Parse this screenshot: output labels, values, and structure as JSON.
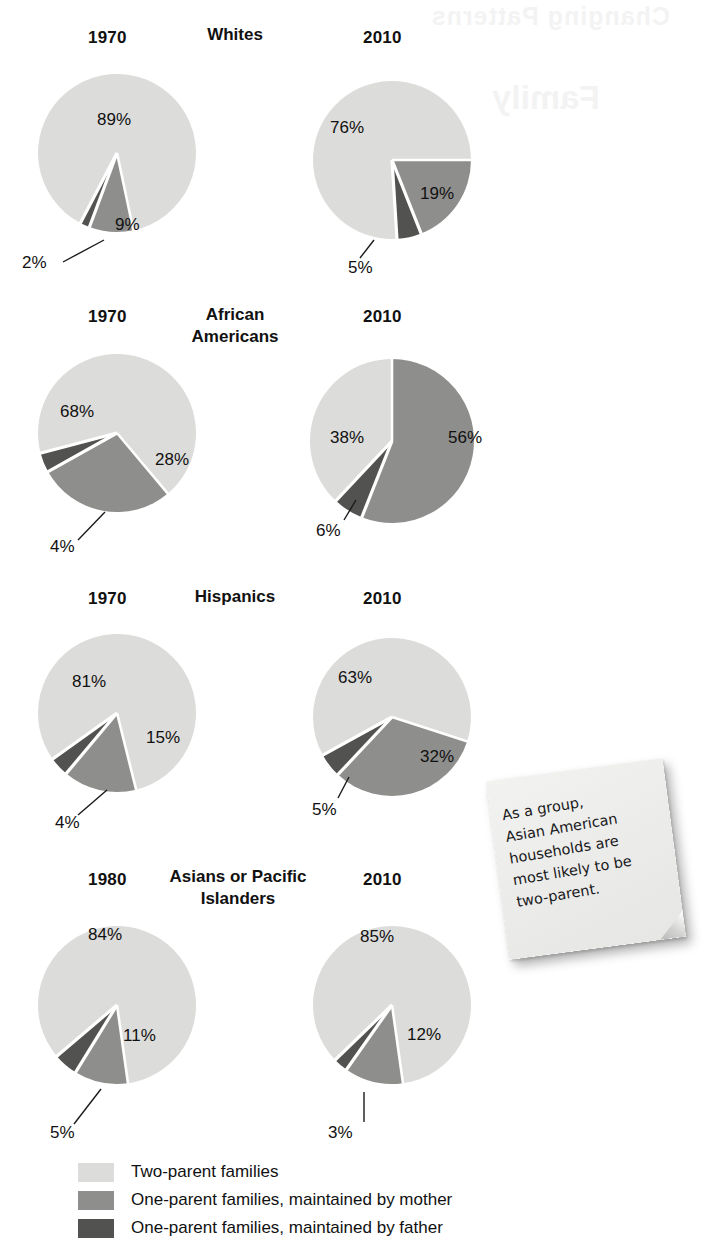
{
  "colors": {
    "two_parent": "#dcdcda",
    "mother": "#8e8e8c",
    "father": "#525250",
    "gap": "#ffffff",
    "text": "#111111",
    "note_paper": "#eeeeec"
  },
  "ghost_text": "Changing Patterns",
  "ghost_text2": "Family",
  "rows": [
    {
      "group": "Whites",
      "left": {
        "year": "1970",
        "two_parent": "89%",
        "mother": "9%",
        "father": "2%",
        "two_parent_value": 89,
        "mother_value": 9,
        "father_value": 2
      },
      "right": {
        "year": "2010",
        "two_parent": "76%",
        "mother": "19%",
        "father": "5%",
        "two_parent_value": 76,
        "mother_value": 19,
        "father_value": 5
      }
    },
    {
      "group": "African\nAmericans",
      "left": {
        "year": "1970",
        "two_parent": "68%",
        "mother": "28%",
        "father": "4%",
        "two_parent_value": 68,
        "mother_value": 28,
        "father_value": 4
      },
      "right": {
        "year": "2010",
        "two_parent": "38%",
        "mother": "56%",
        "father": "6%",
        "two_parent_value": 38,
        "mother_value": 56,
        "father_value": 6
      }
    },
    {
      "group": "Hispanics",
      "left": {
        "year": "1970",
        "two_parent": "81%",
        "mother": "15%",
        "father": "4%",
        "two_parent_value": 81,
        "mother_value": 15,
        "father_value": 4
      },
      "right": {
        "year": "2010",
        "two_parent": "63%",
        "mother": "32%",
        "father": "5%",
        "two_parent_value": 63,
        "mother_value": 32,
        "father_value": 5
      }
    },
    {
      "group": "Asians or Pacific\nIslanders",
      "left": {
        "year": "1980",
        "two_parent": "84%",
        "mother": "11%",
        "father": "5%",
        "two_parent_value": 84,
        "mother_value": 11,
        "father_value": 5
      },
      "right": {
        "year": "2010",
        "two_parent": "85%",
        "mother": "12%",
        "father": "3%",
        "two_parent_value": 85,
        "mother_value": 12,
        "father_value": 3
      }
    }
  ],
  "note": {
    "text": "As a group,\nAsian American\nhouseholds are\nmost likely to be\ntwo-parent."
  },
  "legend": {
    "items": [
      {
        "label": "Two-parent families",
        "color": "#dcdcda"
      },
      {
        "label": "One-parent families, maintained by mother",
        "color": "#8e8e8c"
      },
      {
        "label": "One-parent families, maintained by father",
        "color": "#525250"
      }
    ]
  },
  "chart_data": {
    "type": "pie",
    "series_names": [
      "Two-parent families",
      "One-parent families, maintained by mother",
      "One-parent families, maintained by father"
    ],
    "units": "percent",
    "charts": [
      {
        "group": "Whites",
        "year": "1970",
        "labels": [
          "Two-parent families",
          "One-parent families, maintained by mother",
          "One-parent families, maintained by father"
        ],
        "values": [
          89,
          9,
          2
        ]
      },
      {
        "group": "Whites",
        "year": "2010",
        "labels": [
          "Two-parent families",
          "One-parent families, maintained by mother",
          "One-parent families, maintained by father"
        ],
        "values": [
          76,
          19,
          5
        ]
      },
      {
        "group": "African Americans",
        "year": "1970",
        "labels": [
          "Two-parent families",
          "One-parent families, maintained by mother",
          "One-parent families, maintained by father"
        ],
        "values": [
          68,
          28,
          4
        ]
      },
      {
        "group": "African Americans",
        "year": "2010",
        "labels": [
          "Two-parent families",
          "One-parent families, maintained by mother",
          "One-parent families, maintained by father"
        ],
        "values": [
          38,
          56,
          6
        ]
      },
      {
        "group": "Hispanics",
        "year": "1970",
        "labels": [
          "Two-parent families",
          "One-parent families, maintained by mother",
          "One-parent families, maintained by father"
        ],
        "values": [
          81,
          15,
          4
        ]
      },
      {
        "group": "Hispanics",
        "year": "2010",
        "labels": [
          "Two-parent families",
          "One-parent families, maintained by mother",
          "One-parent families, maintained by father"
        ],
        "values": [
          63,
          32,
          5
        ]
      },
      {
        "group": "Asians or Pacific Islanders",
        "year": "1980",
        "labels": [
          "Two-parent families",
          "One-parent families, maintained by mother",
          "One-parent families, maintained by father"
        ],
        "values": [
          84,
          11,
          5
        ]
      },
      {
        "group": "Asians or Pacific Islanders",
        "year": "2010",
        "labels": [
          "Two-parent families",
          "One-parent families, maintained by mother",
          "One-parent families, maintained by father"
        ],
        "values": [
          85,
          12,
          3
        ]
      }
    ],
    "annotation": "As a group, Asian American households are most likely to be two-parent.",
    "legend_position": "bottom-left"
  }
}
